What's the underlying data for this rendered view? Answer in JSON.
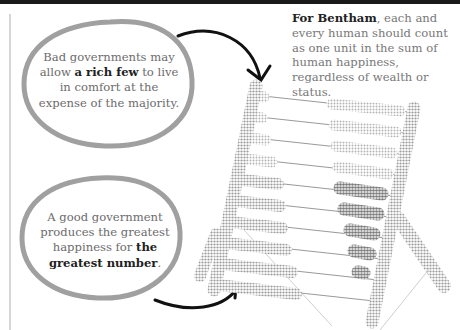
{
  "bubbles": [
    {
      "id": "bad-government",
      "before": "Bad governments may allow ",
      "emphasis": "a rich few",
      "after": " to live in comfort at the expense of the majority."
    },
    {
      "id": "good-government",
      "before": "A good government produces the greatest happiness for ",
      "emphasis": "the greatest number",
      "after": "."
    }
  ],
  "quote": {
    "emphasis": "For Bentham",
    "text": ", each and every human should count as one unit in the sum of human happiness, regardless of wealth or status."
  },
  "illustration": {
    "subject": "abacus",
    "rows": 10,
    "colors": {
      "frame": "#b0b0b0",
      "light_beads": "#c4c4c4",
      "dark_beads": "#8a8a8a",
      "bubble_outline": "#9a9a9a",
      "arrow": "#111111"
    }
  }
}
